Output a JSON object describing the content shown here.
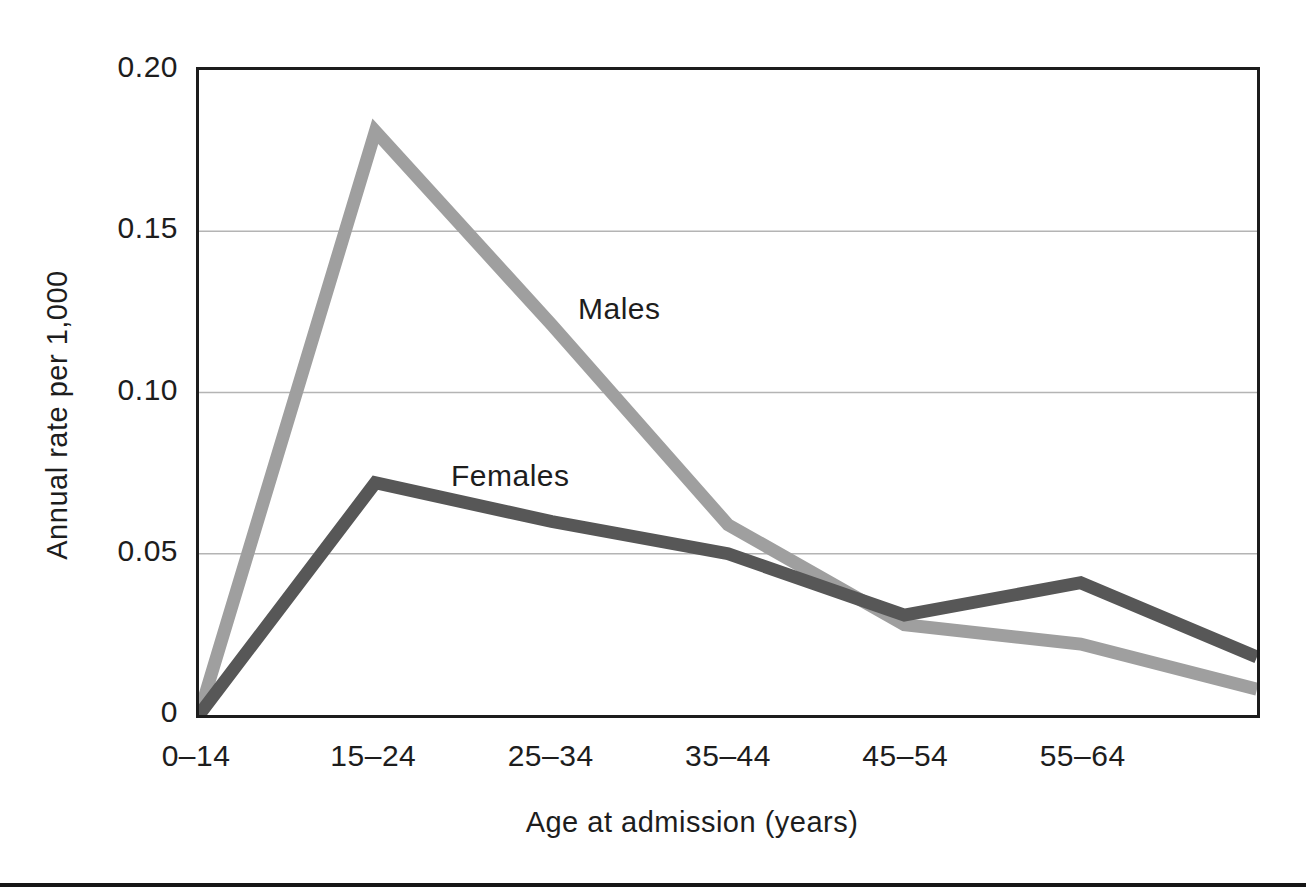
{
  "figure": {
    "background_color": "#ffffff",
    "frame_color": "#1c1c1c",
    "grid_color": "#b4b4b4",
    "text_color": "#1d1d1d",
    "bottom_rule_color": "#161616"
  },
  "chart_data": {
    "type": "line",
    "title": "",
    "xlabel": "Age at admission (years)",
    "ylabel": "Annual rate per 1,000",
    "x_tick_labels": [
      "0–14",
      "15–24",
      "25–34",
      "35–44",
      "45–54",
      "55–64"
    ],
    "y_tick_labels": [
      "0.20",
      "0.15",
      "0.10",
      "0.05",
      "0"
    ],
    "y_tick_values": [
      0.2,
      0.15,
      0.1,
      0.05,
      0
    ],
    "ylim": [
      0,
      0.2
    ],
    "gridline_values": [
      0.15,
      0.1,
      0.05
    ],
    "grid_on": true,
    "legend_position": "inline-labels-on-plot",
    "points_per_series": 7,
    "final_point_unlabeled": true,
    "line_width_px": 13,
    "series": [
      {
        "name": "Males",
        "color": "#9f9f9f",
        "values": [
          0,
          0.181,
          0.121,
          0.059,
          0.028,
          0.022,
          0.008
        ]
      },
      {
        "name": "Females",
        "color": "#575757",
        "values": [
          0,
          0.072,
          0.06,
          0.05,
          0.031,
          0.041,
          0.018
        ]
      }
    ]
  }
}
